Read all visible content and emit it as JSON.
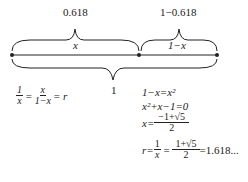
{
  "diagram": {
    "top_labels": {
      "left": "0.618",
      "right": "1−0.618"
    },
    "segment_labels": {
      "left": "x",
      "right": "1−x"
    },
    "bottom_label": "1",
    "ratio_equation": {
      "lhs_num": "1",
      "lhs_den": "x",
      "mid_num": "x",
      "mid_den": "1−x",
      "rhs": "= r"
    },
    "derivation": {
      "line1": "1−x=x²",
      "line2": "x²+x−1=0",
      "line3_lhs": "x=",
      "line3_num": "−1+√5",
      "line3_den": "2",
      "line4_lhs": "r=",
      "line4_frac1_num": "1",
      "line4_frac1_den": "x",
      "line4_frac2_num": "1+√5",
      "line4_frac2_den": "2",
      "line4_result": "=1.618..."
    }
  }
}
